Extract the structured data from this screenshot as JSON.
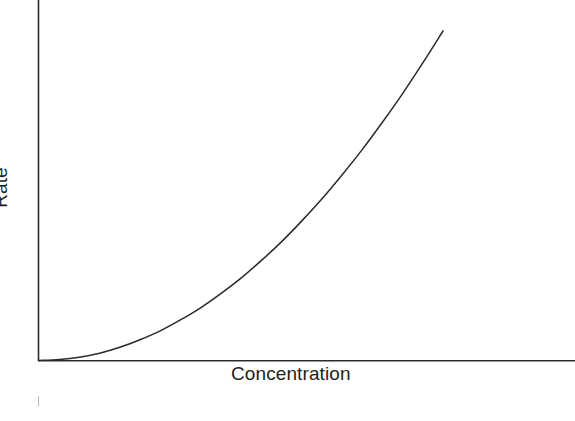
{
  "chart_data": {
    "type": "line",
    "title": "",
    "subtitle": "",
    "xlabel": "Concentration",
    "ylabel": "Rate",
    "legend": [],
    "annotations": [],
    "grid": false,
    "legend_position": "none",
    "xlim": [
      0,
      1
    ],
    "ylim": [
      0,
      1
    ],
    "xticks": [],
    "yticks": [],
    "xticklabels": [],
    "yticklabels": [],
    "series": [
      {
        "name": "rate-vs-concentration",
        "x": [
          0.0,
          0.05,
          0.1,
          0.15,
          0.2,
          0.25,
          0.3,
          0.35,
          0.4,
          0.45,
          0.5,
          0.55,
          0.6,
          0.65,
          0.7,
          0.75,
          0.8,
          0.85,
          0.9,
          0.95,
          1.0
        ],
        "y": [
          0.0,
          0.003,
          0.01,
          0.022,
          0.04,
          0.063,
          0.09,
          0.123,
          0.16,
          0.203,
          0.25,
          0.303,
          0.36,
          0.423,
          0.49,
          0.563,
          0.64,
          0.723,
          0.81,
          0.903,
          1.0
        ]
      }
    ],
    "colors": {
      "curve": "#2a2a2a",
      "axis": "#2a2a2a",
      "background": "#ffffff",
      "text": "#1e1e1e"
    }
  },
  "figure": {
    "x_axis_label": "Concentration",
    "y_axis_label": "Rate"
  }
}
